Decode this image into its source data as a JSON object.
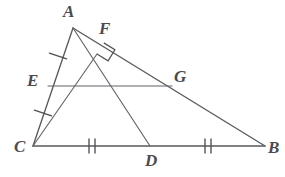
{
  "figure": {
    "type": "geometry-diagram",
    "background_color": "#ffffff",
    "line_color": "#5a5a5e",
    "label_color": "#4a4a4f",
    "canvas": {
      "width": 285,
      "height": 177
    }
  },
  "points": {
    "A": {
      "label": "A",
      "x": 73,
      "y": 28,
      "label_x": 63,
      "label_y": 3
    },
    "B": {
      "label": "B",
      "x": 265,
      "y": 146,
      "label_x": 268,
      "label_y": 139
    },
    "C": {
      "label": "C",
      "x": 33,
      "y": 146,
      "label_x": 14,
      "label_y": 138
    },
    "D": {
      "label": "D",
      "x": 150,
      "y": 146,
      "label_x": 145,
      "label_y": 152
    },
    "E": {
      "label": "E",
      "x": 48,
      "y": 86,
      "label_x": 27,
      "label_y": 72
    },
    "F": {
      "label": "F",
      "x": 97,
      "y": 54,
      "label_x": 99,
      "label_y": 20
    },
    "G": {
      "label": "G",
      "x": 172,
      "y": 86,
      "label_x": 174,
      "label_y": 68
    }
  },
  "segments": [
    {
      "name": "side-AC",
      "from": "A",
      "to": "C",
      "x1": 73,
      "y1": 28,
      "x2": 33,
      "y2": 146
    },
    {
      "name": "side-CB",
      "from": "C",
      "to": "B",
      "x1": 33,
      "y1": 146,
      "x2": 265,
      "y2": 146
    },
    {
      "name": "side-AB",
      "from": "A",
      "to": "B",
      "x1": 73,
      "y1": 28,
      "x2": 265,
      "y2": 146
    },
    {
      "name": "median-AD",
      "from": "A",
      "to": "D",
      "x1": 73,
      "y1": 28,
      "x2": 150,
      "y2": 146
    },
    {
      "name": "altitude-CF",
      "from": "C",
      "to": "F",
      "x1": 33,
      "y1": 146,
      "x2": 97,
      "y2": 54
    },
    {
      "name": "midsegment-EG",
      "from": "E",
      "to": "G",
      "x1": 48,
      "y1": 86,
      "x2": 172,
      "y2": 86
    }
  ],
  "marks": {
    "single_ticks": [
      {
        "name": "tick-AE",
        "on_segment": "AC",
        "x": 58,
        "y": 56,
        "angle": 18
      },
      {
        "name": "tick-EC",
        "on_segment": "AC",
        "x": 43,
        "y": 113,
        "angle": 18
      }
    ],
    "double_ticks": [
      {
        "name": "tick-CD",
        "on_segment": "CB",
        "x": 92,
        "y": 146
      },
      {
        "name": "tick-DB",
        "on_segment": "CB",
        "x": 208,
        "y": 146
      }
    ],
    "right_angle": {
      "name": "right-angle-at-F",
      "vertex_x": 97,
      "vertex_y": 54,
      "size": 13
    }
  }
}
